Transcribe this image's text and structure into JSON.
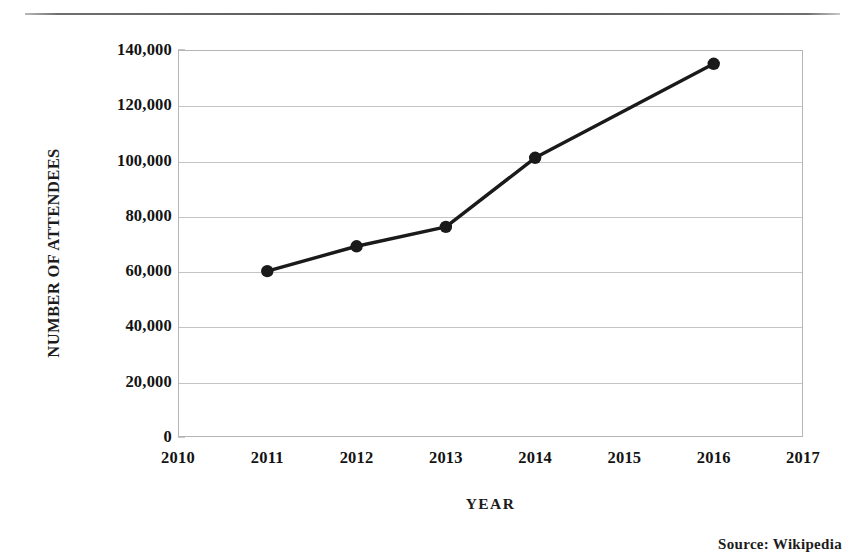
{
  "figure": {
    "source_note": "Source:  Wikipedia",
    "rule_color": "#555555"
  },
  "chart_data": {
    "type": "line",
    "title": "",
    "xlabel": "YEAR",
    "ylabel": "NUMBER OF ATTENDEES",
    "x": [
      2011,
      2012,
      2013,
      2014,
      2016
    ],
    "values": [
      60000,
      69000,
      76000,
      101000,
      135000
    ],
    "series": [
      {
        "name": "Number of attendees",
        "x": [
          2011,
          2012,
          2013,
          2014,
          2016
        ],
        "values": [
          60000,
          69000,
          76000,
          101000,
          135000
        ]
      }
    ],
    "xlim": [
      2010,
      2017
    ],
    "ylim": [
      0,
      140000
    ],
    "x_tick_labels": [
      "2010",
      "2011",
      "2012",
      "2013",
      "2014",
      "2015",
      "2016",
      "2017"
    ],
    "x_ticks": [
      2010,
      2011,
      2012,
      2013,
      2014,
      2015,
      2016,
      2017
    ],
    "y_tick_labels": [
      "140,000",
      "120,000",
      "100,000",
      "80,000",
      "60,000",
      "40,000",
      "20,000",
      "0"
    ],
    "y_ticks": [
      140000,
      120000,
      100000,
      80000,
      60000,
      40000,
      20000,
      0
    ],
    "grid": true,
    "grid_axis": "y",
    "legend": false,
    "legend_position": "none",
    "line_color": "#1a1a1a",
    "marker": "circle",
    "marker_color": "#1a1a1a",
    "annotations": []
  }
}
